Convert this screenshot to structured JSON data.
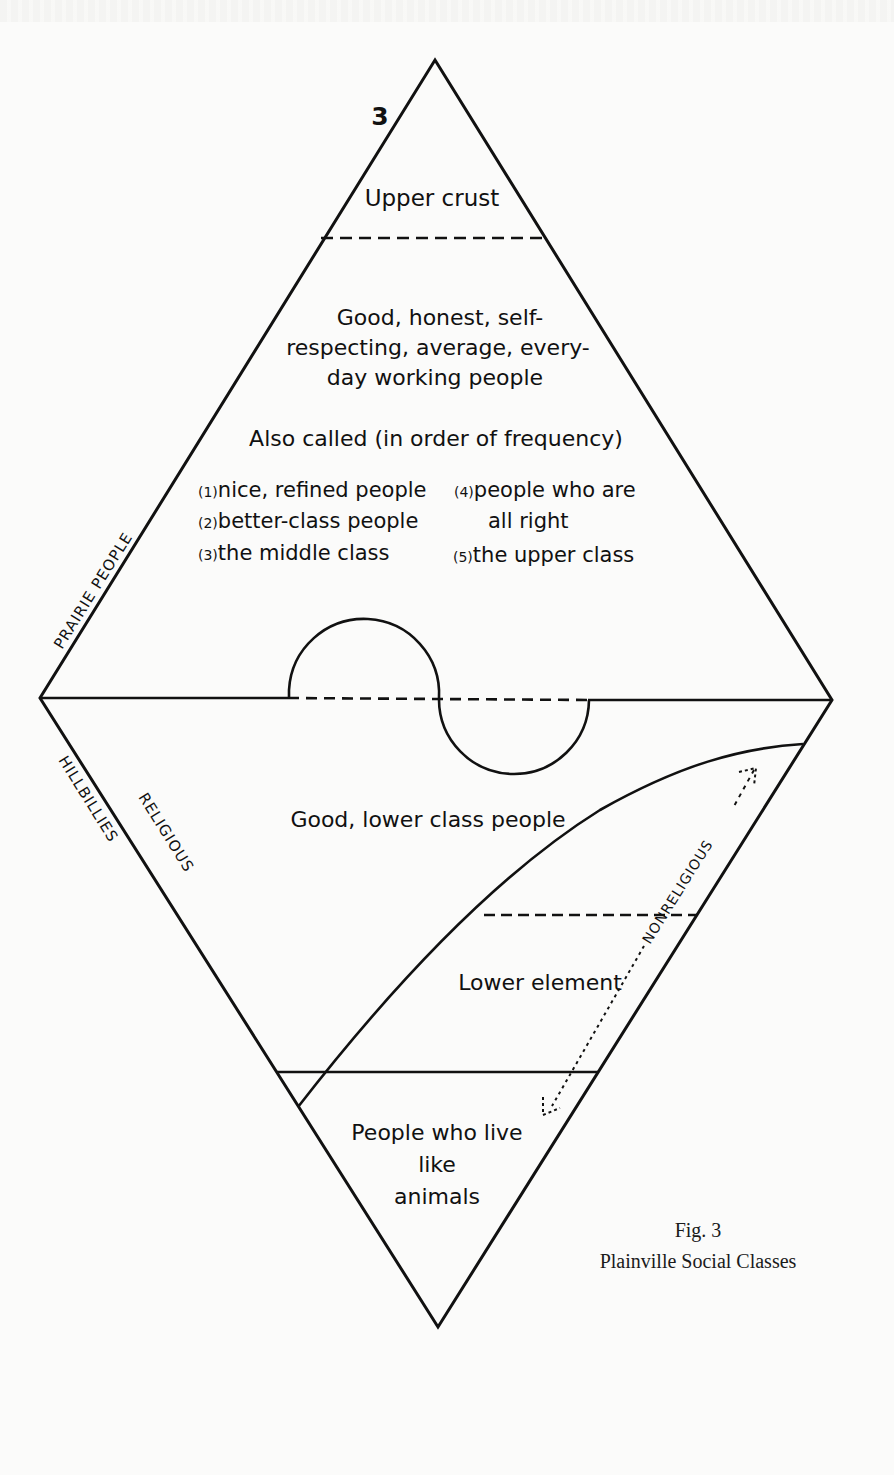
{
  "figure": {
    "number_mark": "3",
    "caption_fig": "Fig. 3",
    "caption_title": "Plainville Social Classes"
  },
  "side_labels": {
    "upper_left": "PRAIRIE PEOPLE",
    "lower_left_outer": "HILLBILLIES",
    "lower_left_inner": "RELIGIOUS",
    "lower_right": "NONRELIGIOUS"
  },
  "strata": {
    "upper_crust": "Upper crust",
    "good_honest": {
      "line1": "Good, honest, self-",
      "line2": "respecting, average, every-",
      "line3": "day working people"
    },
    "also_called": {
      "heading": "Also called (in order of frequency)",
      "items": [
        {
          "num": "(1)",
          "text": "nice, refined people"
        },
        {
          "num": "(2)",
          "text": "better-class people"
        },
        {
          "num": "(3)",
          "text": "the middle class"
        },
        {
          "num": "(4)",
          "text": "people who are",
          "text2": "all right"
        },
        {
          "num": "(5)",
          "text": "the upper class"
        }
      ]
    },
    "good_lower": "Good, lower class people",
    "lower_element": "Lower element",
    "animals": {
      "line1": "People who live",
      "line2": "like",
      "line3": "animals"
    }
  },
  "colors": {
    "ink": "#111111",
    "paper": "#fbfbfa"
  }
}
